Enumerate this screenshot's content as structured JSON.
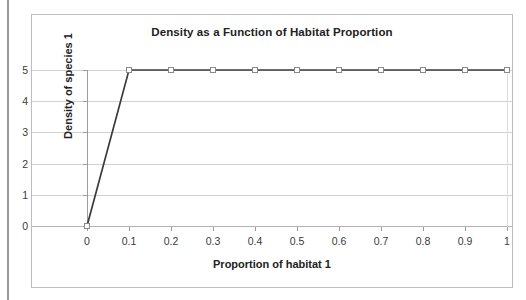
{
  "chart_data": {
    "type": "line",
    "title": "Density as a Function of Habitat Proportion",
    "xlabel": "Proportion of habitat 1",
    "ylabel": "Density of species 1",
    "x": [
      0,
      0.1,
      0.2,
      0.3,
      0.4,
      0.5,
      0.6,
      0.7,
      0.8,
      0.9,
      1
    ],
    "values": [
      0,
      5,
      5,
      5,
      5,
      5,
      5,
      5,
      5,
      5,
      5
    ],
    "series": [
      {
        "name": "Density of species 1",
        "values": [
          0,
          5,
          5,
          5,
          5,
          5,
          5,
          5,
          5,
          5,
          5
        ]
      }
    ],
    "xtick_labels": [
      "0",
      "0.1",
      "0.2",
      "0.3",
      "0.4",
      "0.5",
      "0.6",
      "0.7",
      "0.8",
      "0.9",
      "1"
    ],
    "ytick_labels": [
      "0",
      "1",
      "2",
      "3",
      "4",
      "5"
    ],
    "ytick_values": [
      0,
      1,
      2,
      3,
      4,
      5
    ],
    "xlim": [
      0,
      1
    ],
    "ylim": [
      0,
      5
    ],
    "grid": "horizontal",
    "legend": "none",
    "marker": "open-square",
    "line_color": "#3b3b3b",
    "marker_fill": "#ffffff",
    "marker_stroke": "#8a8a8a",
    "grid_color": "#d2d2d2",
    "axis_color": "#9d9d9d",
    "text_color": "#222222",
    "background": "#ffffff",
    "border_color": "#bdbdbd"
  }
}
